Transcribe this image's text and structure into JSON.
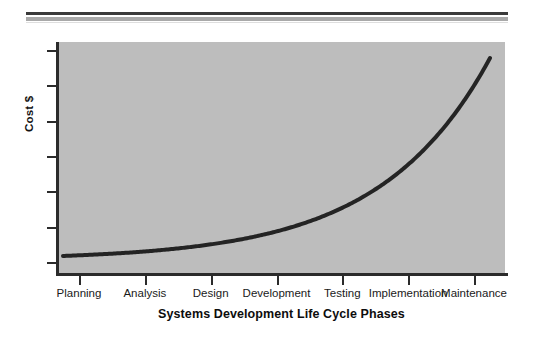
{
  "chart_data": {
    "type": "line",
    "title": "",
    "xlabel": "Systems Development Life Cycle Phases",
    "ylabel": "Cost $",
    "categories": [
      "Planning",
      "Analysis",
      "Design",
      "Development",
      "Testing",
      "Implementation",
      "Maintenance"
    ],
    "series": [
      {
        "name": "Cost of change",
        "values": [
          2,
          4,
          8,
          16,
          30,
          58,
          100
        ]
      }
    ],
    "x": [
      1,
      2,
      3,
      4,
      5,
      6,
      7
    ],
    "ylim": [
      0,
      100
    ],
    "xlim": [
      0.6,
      7.4
    ],
    "y_tick_count": 7,
    "y_tick_labels": [
      "",
      "",
      "",
      "",
      "",
      "",
      ""
    ],
    "grid": false,
    "legend": "none",
    "annotations": [],
    "style": {
      "plot_background": "#bdbdbd",
      "page_background": "#ffffff",
      "line_color": "#242424",
      "line_width_px": 4,
      "axis_color": "#2b2b2b",
      "rule_dark_color": "#3a3a3a",
      "rule_gray_color": "#a9a9a9"
    }
  },
  "axes": {
    "y_title": "Cost $",
    "x_title": "Systems Development Life Cycle Phases"
  },
  "x_ticks": [
    {
      "label": "Planning"
    },
    {
      "label": "Analysis"
    },
    {
      "label": "Design"
    },
    {
      "label": "Development"
    },
    {
      "label": "Testing"
    },
    {
      "label": "Implementation"
    },
    {
      "label": "Maintenance"
    }
  ]
}
